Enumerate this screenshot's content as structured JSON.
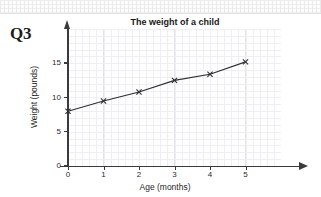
{
  "question": {
    "label": "Q3"
  },
  "chart_data": {
    "type": "line",
    "title": "The weight of a child",
    "xlabel": "Age (months)",
    "ylabel": "Weight (pounds)",
    "x": [
      0,
      1,
      2,
      3,
      4,
      5
    ],
    "values": [
      8,
      9.5,
      10.8,
      12.5,
      13.4,
      15.2
    ],
    "xticks": [
      "0",
      "1",
      "2",
      "3",
      "4",
      "5"
    ],
    "yticks": [
      "0",
      "5",
      "10",
      "15"
    ],
    "xlim": [
      0,
      6
    ],
    "ylim": [
      0,
      20
    ],
    "grid": true,
    "legend": "none",
    "marker": "cross",
    "line_color": "#2f2f2f",
    "grid_color": "#e2e2ea",
    "axis_color": "#3a3a3a"
  }
}
